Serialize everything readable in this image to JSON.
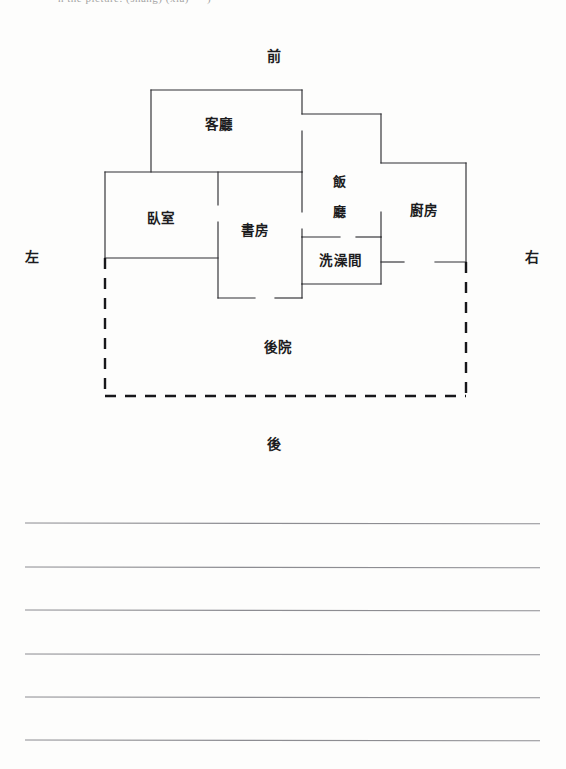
{
  "page": {
    "top_sliver_text": "h the picture. (shang) (xia)   —   )   -",
    "background_color": "#fdfdfc",
    "ink_color": "#2e2e32"
  },
  "floor_plan": {
    "title": "",
    "directions": [
      {
        "key": "front",
        "label": "前",
        "x": 274,
        "y": 57
      },
      {
        "key": "left",
        "label": "左",
        "x": 32,
        "y": 258
      },
      {
        "key": "right",
        "label": "右",
        "x": 532,
        "y": 258
      },
      {
        "key": "back",
        "label": "後",
        "x": 274,
        "y": 445
      }
    ],
    "rooms": [
      {
        "key": "living-room",
        "label": "客廳",
        "x": 219,
        "y": 125,
        "stacked": false
      },
      {
        "key": "dining-room",
        "label": "飯廳",
        "x": 340,
        "y": 182,
        "stacked": true,
        "lines": [
          "飯",
          "廳"
        ]
      },
      {
        "key": "kitchen",
        "label": "廚房",
        "x": 424,
        "y": 211,
        "stacked": false
      },
      {
        "key": "bedroom",
        "label": "臥室",
        "x": 161,
        "y": 219,
        "stacked": false
      },
      {
        "key": "study",
        "label": "書房",
        "x": 255,
        "y": 231,
        "stacked": false
      },
      {
        "key": "bathroom",
        "label": "洗澡間",
        "x": 341,
        "y": 261,
        "stacked": false
      },
      {
        "key": "courtyard",
        "label": "後院",
        "x": 278,
        "y": 348,
        "stacked": false
      }
    ],
    "solid_walls": [
      "M151,90 L302,90",
      "M151,90 L151,172",
      "M302,90 L302,114",
      "M302,114 L381,114",
      "M381,114 L381,163",
      "M302,131 L302,172",
      "M105,172 L302,172",
      "M381,163 L466,163",
      "M466,163 L466,262",
      "M105,172 L105,258",
      "M218,172 L218,205",
      "M218,222 L218,298",
      "M302,172 L302,212",
      "M302,229 L302,237",
      "M381,212 L381,237",
      "M302,237 L340,237",
      "M356,237 L381,237",
      "M302,237 L302,284",
      "M381,237 L381,284",
      "M302,284 L381,284",
      "M105,258 L218,258",
      "M381,262 L404,262",
      "M435,262 L466,262",
      "M218,298 L255,298",
      "M275,298 L302,298",
      "M302,284 L302,298"
    ],
    "dashed_walls": [
      "M105,258 L105,396",
      "M466,262 L466,396",
      "M105,396 L466,396"
    ]
  },
  "writing_lines": {
    "count": 6,
    "x_start": 25,
    "x_end": 540,
    "y_positions": [
      43,
      87,
      130,
      174,
      217,
      260
    ]
  }
}
